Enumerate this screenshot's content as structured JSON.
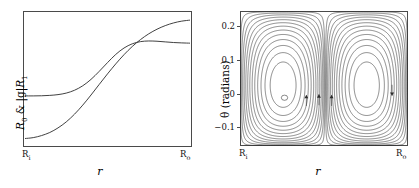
{
  "figure": {
    "panel_count": 2,
    "background_color": "#ffffff",
    "line_color": "#2b2b2b",
    "frame_color": "#4a4a4a"
  },
  "left_panel": {
    "ylabel_parts": {
      "r0": "R",
      "r0_sub": "0",
      "amp": " & |g|",
      "r1": "R",
      "r1_sub": "1"
    },
    "xlabel": "r",
    "xtick_labels": [
      {
        "text": "R",
        "sub": "i"
      },
      {
        "text": "R",
        "sub": "o"
      }
    ]
  },
  "right_panel": {
    "ylabel": "θ (radians)",
    "xlabel": "r",
    "ytick_labels": [
      "0.2",
      "0.1",
      "0",
      "−0.1"
    ],
    "xtick_labels": [
      {
        "text": "R",
        "sub": "i"
      },
      {
        "text": "R",
        "sub": "o"
      }
    ]
  },
  "chart_data": [
    {
      "type": "line",
      "title": "",
      "xlabel": "r",
      "ylabel": "R_0 & |g|R_1",
      "xlim": [
        0,
        1
      ],
      "ylim": [
        0,
        1
      ],
      "xtick_values": [
        0,
        1
      ],
      "xtick_labels": [
        "R_i",
        "R_o"
      ],
      "ytick_values": [],
      "ytick_labels": [],
      "grid": false,
      "legend": "none",
      "series": [
        {
          "name": "R_0",
          "comment": "monotone sigmoid rising from low at R_i to high plateau at R_o",
          "x": [
            0.0,
            0.05,
            0.1,
            0.15,
            0.2,
            0.25,
            0.3,
            0.35,
            0.4,
            0.45,
            0.5,
            0.55,
            0.6,
            0.65,
            0.7,
            0.75,
            0.8,
            0.85,
            0.9,
            0.95,
            1.0
          ],
          "y": [
            0.035,
            0.042,
            0.058,
            0.082,
            0.118,
            0.165,
            0.225,
            0.296,
            0.375,
            0.458,
            0.54,
            0.618,
            0.69,
            0.754,
            0.808,
            0.853,
            0.889,
            0.917,
            0.938,
            0.952,
            0.96
          ]
        },
        {
          "name": "|g|R_1",
          "comment": "flat low near R_i, rises through middle, plateaus high with slight droop at R_o",
          "x": [
            0.0,
            0.05,
            0.1,
            0.15,
            0.2,
            0.25,
            0.3,
            0.35,
            0.4,
            0.45,
            0.5,
            0.55,
            0.6,
            0.65,
            0.7,
            0.75,
            0.8,
            0.85,
            0.9,
            0.95,
            1.0
          ],
          "y": [
            0.368,
            0.368,
            0.369,
            0.372,
            0.378,
            0.39,
            0.412,
            0.447,
            0.497,
            0.56,
            0.628,
            0.692,
            0.742,
            0.775,
            0.792,
            0.797,
            0.795,
            0.79,
            0.785,
            0.782,
            0.78
          ]
        }
      ],
      "annotations": [
        {
          "text": "curves cross near r=0.22 and r=0.75"
        }
      ]
    },
    {
      "type": "line",
      "subtype": "streamline-contour",
      "title": "",
      "xlabel": "r",
      "ylabel": "θ (radians)",
      "xlim": [
        0,
        1
      ],
      "ylim": [
        -0.155,
        0.245
      ],
      "xtick_values": [
        0,
        1
      ],
      "xtick_labels": [
        "R_i",
        "R_o"
      ],
      "ytick_values": [
        0.2,
        0.1,
        0.0,
        -0.1
      ],
      "ytick_labels": [
        "0.2",
        "0.1",
        "0",
        "−0.1"
      ],
      "grid": false,
      "legend": "none",
      "contour_count": 13,
      "vortices": [
        {
          "name": "left-cell",
          "center_x": 0.265,
          "center_y": -0.012,
          "rotation": "counter-clockwise"
        },
        {
          "name": "right-cell",
          "center_x": 0.705,
          "center_y": -0.012,
          "rotation": "clockwise"
        }
      ],
      "arrows": [
        {
          "x": 0.395,
          "y": -0.02,
          "direction": "up"
        },
        {
          "x": 0.47,
          "y": -0.018,
          "direction": "up"
        },
        {
          "x": 0.545,
          "y": -0.02,
          "direction": "up"
        },
        {
          "x": 0.905,
          "y": 0.01,
          "direction": "down"
        }
      ],
      "annotations": [
        {
          "text": "dense contour bundles along top and side walls"
        },
        {
          "text": "open gap in upper-right region"
        }
      ]
    }
  ]
}
